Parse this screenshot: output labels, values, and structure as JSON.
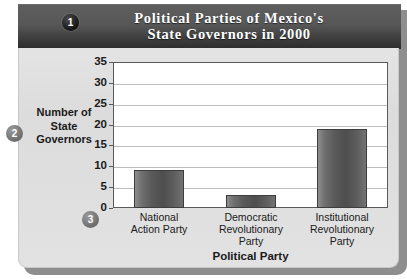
{
  "banner": {
    "title_line1": "Political Parties of Mexico's",
    "title_line2": "State Governors in 2000",
    "badge_1": "1"
  },
  "callouts": {
    "badge_2": "2",
    "badge_3": "3"
  },
  "chart_data": {
    "type": "bar",
    "title": "Political Parties of Mexico's State Governors in 2000",
    "xlabel": "Political Party",
    "ylabel": "Number of State Governors",
    "ylabel_lines": [
      "Number of",
      "State",
      "Governors"
    ],
    "categories": [
      "National Action Party",
      "Democratic Revolutionary Party",
      "Institutional Revolutionary Party"
    ],
    "category_lines": [
      [
        "National",
        "Action Party"
      ],
      [
        "Democratic",
        "Revolutionary",
        "Party"
      ],
      [
        "Institutional",
        "Revolutionary",
        "Party"
      ]
    ],
    "values": [
      9,
      3,
      19
    ],
    "ylim": [
      0,
      35
    ],
    "ytick_labels": [
      "0",
      "5",
      "10",
      "15",
      "20",
      "25",
      "30",
      "35"
    ],
    "ytick_values": [
      0,
      5,
      10,
      15,
      20,
      25,
      30,
      35
    ],
    "grid": true,
    "legend": "none",
    "bar_color": "#565656",
    "plot_background": "#ffffff"
  }
}
